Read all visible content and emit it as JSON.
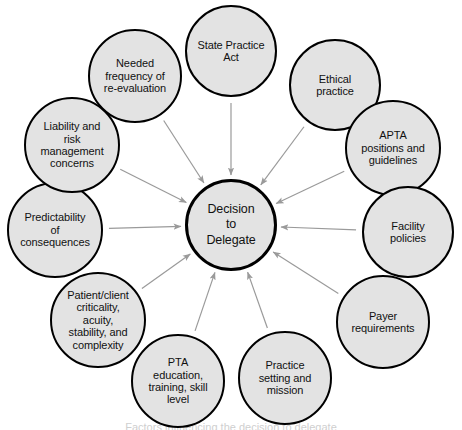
{
  "diagram": {
    "type": "hub-and-spoke",
    "center": {
      "id": "decision-to-delegate",
      "label": "Decision\nto\nDelegate",
      "cx": 231,
      "cy": 225,
      "r": 46
    },
    "colors": {
      "node_fill": "#e3e3e3",
      "node_stroke": "#000000",
      "arrow": "#9a9a9a",
      "background": "#ffffff",
      "text": "#111111"
    },
    "arrow_direction": "inward",
    "nodes": [
      {
        "id": "state-practice-act",
        "label": "State Practice\nAct",
        "cx": 231,
        "cy": 51,
        "r": 46
      },
      {
        "id": "ethical-practice",
        "label": "Ethical\npractice",
        "cx": 335,
        "cy": 85,
        "r": 46
      },
      {
        "id": "apta-positions-and-guidelines",
        "label": "APTA\npositions and\nguidelines",
        "cx": 393,
        "cy": 148,
        "r": 48
      },
      {
        "id": "facility-policies",
        "label": "Facility\npolicies",
        "cx": 408,
        "cy": 232,
        "r": 46
      },
      {
        "id": "payer-requirements",
        "label": "Payer\nrequirements",
        "cx": 383,
        "cy": 322,
        "r": 47
      },
      {
        "id": "practice-setting-and-mission",
        "label": "Practice\nsetting and\nmission",
        "cx": 285,
        "cy": 378,
        "r": 47
      },
      {
        "id": "pta-education-training-skill-level",
        "label": "PTA\neducation,\ntraining, skill\nlevel",
        "cx": 178,
        "cy": 381,
        "r": 47
      },
      {
        "id": "patient-client-criticality",
        "label": "Patient/client\ncriticality,\nacuity,\nstability, and\ncomplexity",
        "cx": 98,
        "cy": 320,
        "r": 48
      },
      {
        "id": "predictability-of-consequences",
        "label": "Predictability\nof consequences",
        "cx": 55,
        "cy": 230,
        "r": 48
      },
      {
        "id": "liability-and-risk-management-concerns",
        "label": "Liability and\nrisk\nmanagement\nconcerns",
        "cx": 72,
        "cy": 145,
        "r": 48
      },
      {
        "id": "needed-frequency-of-re-evaluation",
        "label": "Needed\nfrequency of\nre-evaluation",
        "cx": 135,
        "cy": 76,
        "r": 47
      }
    ],
    "caption": "Factors influencing the decision to delegate"
  }
}
